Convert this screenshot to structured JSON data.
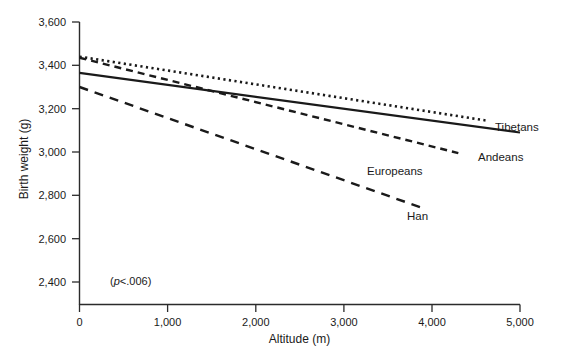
{
  "chart_data": {
    "type": "line",
    "title": "",
    "subtitle": "",
    "xlabel": "Altitude (m)",
    "ylabel": "Birth weight (g)",
    "xlim": [
      0,
      5000
    ],
    "ylim": [
      2400,
      3600
    ],
    "xticks": [
      0,
      1000,
      2000,
      3000,
      4000,
      5000
    ],
    "xticklabels": [
      "0",
      "1,000",
      "2,000",
      "3,000",
      "4,000",
      "5,000"
    ],
    "yticks": [
      2400,
      2600,
      2800,
      3000,
      3200,
      3400,
      3600
    ],
    "yticklabels": [
      "2,400",
      "2,600",
      "2,800",
      "3,000",
      "3,200",
      "3,400",
      "3,600"
    ],
    "grid": false,
    "legend": "inline-right-end-labels",
    "annotations": [
      {
        "name": "p-value",
        "text": "(p<.006)",
        "text_italic_part": "p",
        "text_rest": "<.006)",
        "text_open": "(",
        "x": 350,
        "y": 2435
      }
    ],
    "series": [
      {
        "name": "Tibetans",
        "label": "Tibetans",
        "linestyle": "solid",
        "color": "#1a1a1a",
        "x": [
          0,
          5000
        ],
        "y": [
          3365,
          3090
        ],
        "slope_g_per_1000m": -55,
        "label_x": 5060,
        "label_y": 3110
      },
      {
        "name": "Andeans",
        "label": "Andeans",
        "linestyle": "dotted",
        "color": "#1a1a1a",
        "x": [
          0,
          4620
        ],
        "y": [
          3440,
          3145
        ],
        "slope_g_per_1000m": -64,
        "label_x": 4680,
        "label_y": 3035
      },
      {
        "name": "Europeans",
        "label": "Europeans",
        "linestyle": "dashed",
        "color": "#1a1a1a",
        "x": [
          0,
          4300
        ],
        "y": [
          3435,
          2995
        ],
        "slope_g_per_1000m": -102,
        "label_x": 3560,
        "label_y": 2940
      },
      {
        "name": "Han",
        "label": "Han",
        "linestyle": "long-dashed",
        "color": "#1a1a1a",
        "x": [
          0,
          3870
        ],
        "y": [
          3300,
          2745
        ],
        "slope_g_per_1000m": -143,
        "label_x": 3720,
        "label_y": 2675
      }
    ]
  },
  "axes": {
    "y": {
      "title": "Birth weight (g)",
      "labels": {
        "t3600": "3,600",
        "t3400": "3,400",
        "t3200": "3,200",
        "t3000": "3,000",
        "t2800": "2,800",
        "t2600": "2,600",
        "t2400": "2,400"
      }
    },
    "x": {
      "title": "Altitude (m)",
      "labels": {
        "t0": "0",
        "t1000": "1,000",
        "t2000": "2,000",
        "t3000": "3,000",
        "t4000": "4,000",
        "t5000": "5,000"
      }
    }
  },
  "series_labels": {
    "tibetans": "Tibetans",
    "andeans": "Andeans",
    "europeans": "Europeans",
    "han": "Han"
  },
  "annotation": {
    "open_paren": "(",
    "p_italic": "p",
    "rest": "<.006)"
  }
}
